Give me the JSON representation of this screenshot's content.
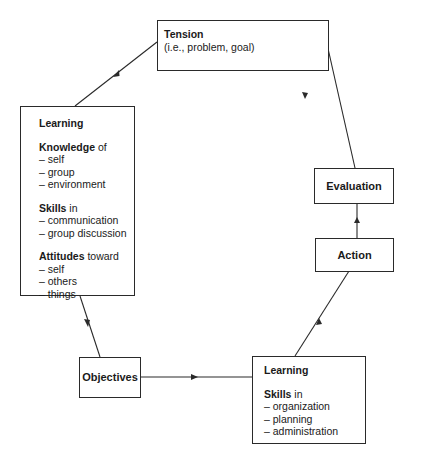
{
  "diagram": {
    "type": "cycle-flow",
    "nodes": {
      "tension": {
        "title": "Tension",
        "subtitle": "(i.e., problem,  goal)"
      },
      "learning_left": {
        "title": "Learning",
        "sections": [
          {
            "heading": "Knowledge",
            "suffix": " of",
            "items": [
              "– self",
              "– group",
              "– environment"
            ]
          },
          {
            "heading": "Skills",
            "suffix": " in",
            "items": [
              "– communication",
              "– group discussion"
            ]
          },
          {
            "heading": "Attitudes",
            "suffix": " toward",
            "items": [
              "– self",
              "– others",
              "– things"
            ]
          }
        ]
      },
      "objectives": {
        "title": "Objectives"
      },
      "learning_right": {
        "title": "Learning",
        "sections": [
          {
            "heading": "Skills",
            "suffix": " in",
            "items": [
              "– organization",
              "– planning",
              "– administration"
            ]
          }
        ]
      },
      "action": {
        "title": "Action"
      },
      "evaluation": {
        "title": "Evaluation"
      }
    },
    "edges": [
      {
        "from": "Tension",
        "to": "Learning (Knowledge/Skills/Attitudes)"
      },
      {
        "from": "Learning (Knowledge/Skills/Attitudes)",
        "to": "Objectives"
      },
      {
        "from": "Objectives",
        "to": "Learning (Skills in organization)"
      },
      {
        "from": "Learning (Skills in organization)",
        "to": "Action"
      },
      {
        "from": "Action",
        "to": "Evaluation"
      },
      {
        "from": "Evaluation",
        "to": "Tension"
      }
    ],
    "colors": {
      "line": "#2a2a2a",
      "background": "#ffffff"
    }
  }
}
